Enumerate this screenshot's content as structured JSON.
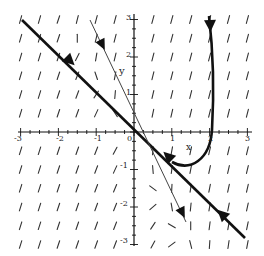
{
  "figure": {
    "type": "phase-portrait",
    "axes": {
      "x_label": "x",
      "y_label": "y",
      "x_ticks": [
        "-3",
        "-2",
        "-1",
        "0",
        "1",
        "2",
        "3"
      ],
      "y_ticks": [
        "3",
        "2",
        "1",
        "0",
        "-1",
        "-2",
        "-3"
      ],
      "xlim": [
        -3,
        3
      ],
      "ylim": [
        -3,
        3
      ]
    },
    "trajectories": [
      {
        "name": "thick-eigenline",
        "from": [
          -3,
          3
        ],
        "to": [
          3,
          -3
        ],
        "arrows": "toward-origin"
      },
      {
        "name": "thin-eigenline",
        "from": [
          -1.1,
          3
        ],
        "to": [
          1.4,
          -2.5
        ],
        "arrows": "away-from-origin"
      },
      {
        "name": "curved-solution",
        "from": [
          2.2,
          3
        ],
        "to": [
          1,
          -1
        ],
        "arrows": "toward-origin"
      }
    ],
    "colors": {
      "ink": "#111111",
      "background": "#ffffff"
    }
  }
}
